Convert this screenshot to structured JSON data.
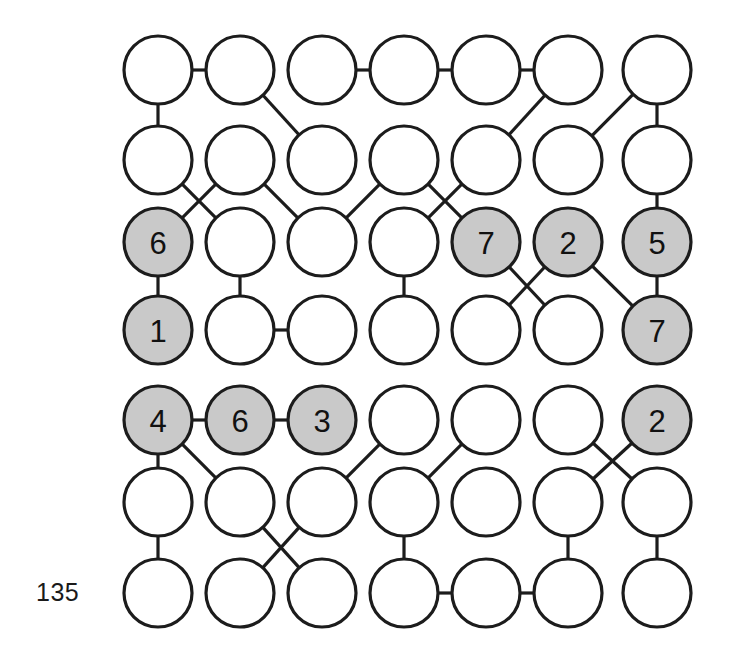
{
  "figure": {
    "caption_label": "135",
    "caption_x": 36,
    "caption_y": 578,
    "background_color": "#ffffff",
    "node_stroke_color": "#1c1c1c",
    "node_fill_plain": "#ffffff",
    "node_fill_shaded": "#c9c9c9",
    "edge_color": "#1c1c1c",
    "node_radius": 34,
    "columns_x": [
      158,
      240,
      322,
      404,
      486,
      568,
      657
    ],
    "rows_y": [
      70,
      160,
      242,
      330,
      420,
      502,
      593
    ]
  },
  "graph": {
    "type": "node-link-grid",
    "rows": 7,
    "columns": 7,
    "blocks": [
      {
        "name": "upper-block",
        "rows": [
          1,
          2,
          3,
          4
        ]
      },
      {
        "name": "lower-block",
        "rows": [
          5,
          6,
          7
        ]
      }
    ],
    "nodes": [
      {
        "id": "r1c1",
        "row": 1,
        "col": 1,
        "label": "",
        "shaded": false
      },
      {
        "id": "r1c2",
        "row": 1,
        "col": 2,
        "label": "",
        "shaded": false
      },
      {
        "id": "r1c3",
        "row": 1,
        "col": 3,
        "label": "",
        "shaded": false
      },
      {
        "id": "r1c4",
        "row": 1,
        "col": 4,
        "label": "",
        "shaded": false
      },
      {
        "id": "r1c5",
        "row": 1,
        "col": 5,
        "label": "",
        "shaded": false
      },
      {
        "id": "r1c6",
        "row": 1,
        "col": 6,
        "label": "",
        "shaded": false
      },
      {
        "id": "r1c7",
        "row": 1,
        "col": 7,
        "label": "",
        "shaded": false
      },
      {
        "id": "r2c1",
        "row": 2,
        "col": 1,
        "label": "",
        "shaded": false
      },
      {
        "id": "r2c2",
        "row": 2,
        "col": 2,
        "label": "",
        "shaded": false
      },
      {
        "id": "r2c3",
        "row": 2,
        "col": 3,
        "label": "",
        "shaded": false
      },
      {
        "id": "r2c4",
        "row": 2,
        "col": 4,
        "label": "",
        "shaded": false
      },
      {
        "id": "r2c5",
        "row": 2,
        "col": 5,
        "label": "",
        "shaded": false
      },
      {
        "id": "r2c6",
        "row": 2,
        "col": 6,
        "label": "",
        "shaded": false
      },
      {
        "id": "r2c7",
        "row": 2,
        "col": 7,
        "label": "",
        "shaded": false
      },
      {
        "id": "r3c1",
        "row": 3,
        "col": 1,
        "label": "6",
        "shaded": true
      },
      {
        "id": "r3c2",
        "row": 3,
        "col": 2,
        "label": "",
        "shaded": false
      },
      {
        "id": "r3c3",
        "row": 3,
        "col": 3,
        "label": "",
        "shaded": false
      },
      {
        "id": "r3c4",
        "row": 3,
        "col": 4,
        "label": "",
        "shaded": false
      },
      {
        "id": "r3c5",
        "row": 3,
        "col": 5,
        "label": "7",
        "shaded": true
      },
      {
        "id": "r3c6",
        "row": 3,
        "col": 6,
        "label": "2",
        "shaded": true
      },
      {
        "id": "r3c7",
        "row": 3,
        "col": 7,
        "label": "5",
        "shaded": true
      },
      {
        "id": "r4c1",
        "row": 4,
        "col": 1,
        "label": "1",
        "shaded": true
      },
      {
        "id": "r4c2",
        "row": 4,
        "col": 2,
        "label": "",
        "shaded": false
      },
      {
        "id": "r4c3",
        "row": 4,
        "col": 3,
        "label": "",
        "shaded": false
      },
      {
        "id": "r4c4",
        "row": 4,
        "col": 4,
        "label": "",
        "shaded": false
      },
      {
        "id": "r4c5",
        "row": 4,
        "col": 5,
        "label": "",
        "shaded": false
      },
      {
        "id": "r4c6",
        "row": 4,
        "col": 6,
        "label": "",
        "shaded": false
      },
      {
        "id": "r4c7",
        "row": 4,
        "col": 7,
        "label": "7",
        "shaded": true
      },
      {
        "id": "r5c1",
        "row": 5,
        "col": 1,
        "label": "4",
        "shaded": true
      },
      {
        "id": "r5c2",
        "row": 5,
        "col": 2,
        "label": "6",
        "shaded": true
      },
      {
        "id": "r5c3",
        "row": 5,
        "col": 3,
        "label": "3",
        "shaded": true
      },
      {
        "id": "r5c4",
        "row": 5,
        "col": 4,
        "label": "",
        "shaded": false
      },
      {
        "id": "r5c5",
        "row": 5,
        "col": 5,
        "label": "",
        "shaded": false
      },
      {
        "id": "r5c6",
        "row": 5,
        "col": 6,
        "label": "",
        "shaded": false
      },
      {
        "id": "r5c7",
        "row": 5,
        "col": 7,
        "label": "2",
        "shaded": true
      },
      {
        "id": "r6c1",
        "row": 6,
        "col": 1,
        "label": "",
        "shaded": false
      },
      {
        "id": "r6c2",
        "row": 6,
        "col": 2,
        "label": "",
        "shaded": false
      },
      {
        "id": "r6c3",
        "row": 6,
        "col": 3,
        "label": "",
        "shaded": false
      },
      {
        "id": "r6c4",
        "row": 6,
        "col": 4,
        "label": "",
        "shaded": false
      },
      {
        "id": "r6c5",
        "row": 6,
        "col": 5,
        "label": "",
        "shaded": false
      },
      {
        "id": "r6c6",
        "row": 6,
        "col": 6,
        "label": "",
        "shaded": false
      },
      {
        "id": "r6c7",
        "row": 6,
        "col": 7,
        "label": "",
        "shaded": false
      },
      {
        "id": "r7c1",
        "row": 7,
        "col": 1,
        "label": "",
        "shaded": false
      },
      {
        "id": "r7c2",
        "row": 7,
        "col": 2,
        "label": "",
        "shaded": false
      },
      {
        "id": "r7c3",
        "row": 7,
        "col": 3,
        "label": "",
        "shaded": false
      },
      {
        "id": "r7c4",
        "row": 7,
        "col": 4,
        "label": "",
        "shaded": false
      },
      {
        "id": "r7c5",
        "row": 7,
        "col": 5,
        "label": "",
        "shaded": false
      },
      {
        "id": "r7c6",
        "row": 7,
        "col": 6,
        "label": "",
        "shaded": false
      },
      {
        "id": "r7c7",
        "row": 7,
        "col": 7,
        "label": "",
        "shaded": false
      }
    ],
    "edges": [
      [
        "r1c1",
        "r1c2"
      ],
      [
        "r1c3",
        "r1c4"
      ],
      [
        "r1c4",
        "r1c5"
      ],
      [
        "r1c5",
        "r1c6"
      ],
      [
        "r1c1",
        "r2c1"
      ],
      [
        "r1c2",
        "r2c3"
      ],
      [
        "r1c6",
        "r2c5"
      ],
      [
        "r1c7",
        "r2c6"
      ],
      [
        "r1c7",
        "r2c7"
      ],
      [
        "r2c1",
        "r3c2"
      ],
      [
        "r2c2",
        "r3c1"
      ],
      [
        "r2c2",
        "r3c3"
      ],
      [
        "r2c4",
        "r3c3"
      ],
      [
        "r2c4",
        "r3c5"
      ],
      [
        "r2c5",
        "r3c4"
      ],
      [
        "r2c7",
        "r3c7"
      ],
      [
        "r3c1",
        "r4c1"
      ],
      [
        "r3c2",
        "r4c2"
      ],
      [
        "r3c4",
        "r4c4"
      ],
      [
        "r3c5",
        "r4c6"
      ],
      [
        "r3c6",
        "r4c5"
      ],
      [
        "r3c6",
        "r4c7"
      ],
      [
        "r3c7",
        "r4c7"
      ],
      [
        "r4c2",
        "r4c3"
      ],
      [
        "r5c1",
        "r5c2"
      ],
      [
        "r5c2",
        "r5c3"
      ],
      [
        "r5c1",
        "r6c1"
      ],
      [
        "r5c1",
        "r6c2"
      ],
      [
        "r5c4",
        "r6c3"
      ],
      [
        "r5c5",
        "r6c4"
      ],
      [
        "r5c6",
        "r6c7"
      ],
      [
        "r5c7",
        "r6c6"
      ],
      [
        "r6c1",
        "r7c1"
      ],
      [
        "r6c2",
        "r7c3"
      ],
      [
        "r6c3",
        "r7c2"
      ],
      [
        "r6c4",
        "r7c4"
      ],
      [
        "r6c6",
        "r7c6"
      ],
      [
        "r6c7",
        "r7c7"
      ],
      [
        "r7c4",
        "r7c5"
      ],
      [
        "r7c5",
        "r7c6"
      ]
    ]
  }
}
